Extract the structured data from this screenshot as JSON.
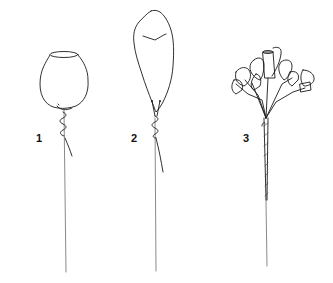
{
  "figure": {
    "steps": [
      {
        "number": "1",
        "subject": "single cup-shaped bloom with wire twisted at base on long stem"
      },
      {
        "number": "2",
        "subject": "tall wrapped teardrop bud with wire twisted at base on long stem"
      },
      {
        "number": "3",
        "subject": "cluster of small cup flowers on branching stems wrapped onto a single taped stem"
      }
    ]
  },
  "colors": {
    "ink": "#1a1a1a",
    "background": "#ffffff"
  }
}
